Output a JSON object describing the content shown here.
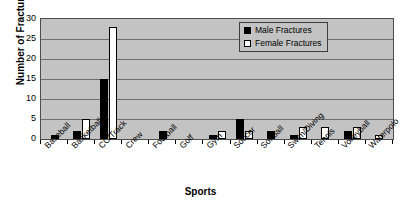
{
  "chart_data": {
    "type": "bar",
    "title": "",
    "xlabel": "Sports",
    "ylabel": "Number of Fractures",
    "ylim": [
      0,
      30
    ],
    "yticks": [
      0,
      5,
      10,
      15,
      20,
      25,
      30
    ],
    "grid": true,
    "legend_position": "top-right",
    "categories": [
      "Baseball",
      "Basketball",
      "CC/Track",
      "Crew",
      "Football",
      "Golf",
      "Gym",
      "Soccer",
      "Softball",
      "Swim/Diving",
      "Tennis",
      "Volleyball",
      "Waterpolo"
    ],
    "series": [
      {
        "name": "Male Fractures",
        "color": "#000000",
        "values": [
          1,
          2,
          15,
          0,
          2,
          0,
          1,
          5,
          2,
          1,
          0,
          2,
          0
        ]
      },
      {
        "name": "Female Fractures",
        "color": "#ffffff",
        "values": [
          0,
          5,
          28,
          0,
          0,
          0,
          2,
          2,
          0,
          3,
          3,
          3,
          1
        ]
      }
    ]
  },
  "legend": {
    "entries": [
      {
        "label": "Male Fractures",
        "swatch": "filled-square-black"
      },
      {
        "label": "Female Fractures",
        "swatch": "hollow-square-white"
      }
    ]
  },
  "colors": {
    "plot_background": "#c3c3c3",
    "gridline": "#6e6e6e",
    "axis": "#000000",
    "male_series": "#000000",
    "female_series": "#ffffff"
  }
}
